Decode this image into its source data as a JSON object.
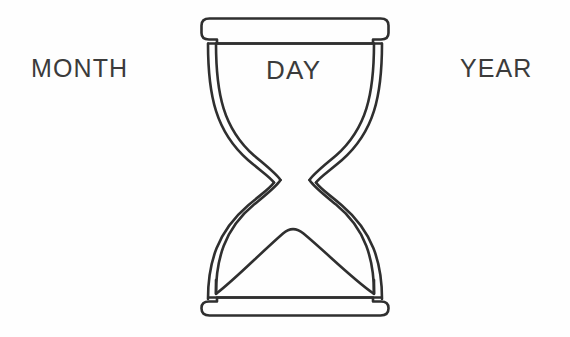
{
  "page": {
    "background_color": "#fefefe",
    "width": 570,
    "height": 337
  },
  "figure": {
    "name": "hourglass",
    "icon": "hourglass-icon",
    "stroke_color": "#2f2f2f",
    "fill_color": "#ffffff",
    "stroke_width": 2.6,
    "parts": [
      {
        "name": "top-cap",
        "label": ""
      },
      {
        "name": "top-bulb",
        "label": ""
      },
      {
        "name": "waist",
        "label": ""
      },
      {
        "name": "bottom-bulb",
        "label": ""
      },
      {
        "name": "sand-mound",
        "label": ""
      },
      {
        "name": "bottom-cap",
        "label": ""
      }
    ]
  },
  "labels": {
    "month": "MONTH",
    "day": "DAY",
    "year": "YEAR"
  },
  "text_style": {
    "color": "#3b3b3b",
    "size_px": 25
  }
}
